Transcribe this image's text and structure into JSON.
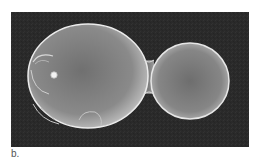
{
  "figure": {
    "caption_label": "b.",
    "colors": {
      "background": "#2a2a2a",
      "cell_fill": "#8c8c8c",
      "cell_rim": "#e6e6e6",
      "page": "#ffffff"
    }
  }
}
